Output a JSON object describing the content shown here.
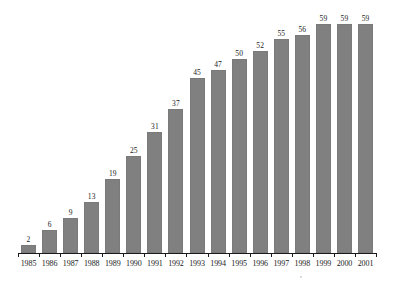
{
  "chart_data": {
    "type": "bar",
    "title": "",
    "subtitle": "",
    "xlabel": "",
    "ylabel": "",
    "categories": [
      "1985",
      "1986",
      "1987",
      "1988",
      "1989",
      "1990",
      "1991",
      "1992",
      "1993",
      "1994",
      "1995",
      "1996",
      "1997",
      "1998",
      "1999",
      "2000",
      "2001"
    ],
    "values": [
      2,
      6,
      9,
      13,
      19,
      25,
      31,
      37,
      45,
      47,
      50,
      52,
      55,
      56,
      59,
      59,
      59
    ],
    "value_labels": [
      "2",
      "6",
      "9",
      "13",
      "19",
      "25",
      "31",
      "37",
      "45",
      "47",
      "50",
      "52",
      "55",
      "56",
      "59",
      "59",
      "59"
    ],
    "ylim": [
      0,
      63
    ],
    "grid": false,
    "legend": null,
    "legend_position": "none",
    "annotations": [],
    "series": [
      {
        "name": "",
        "values": [
          2,
          6,
          9,
          13,
          19,
          25,
          31,
          37,
          45,
          47,
          50,
          52,
          55,
          56,
          59,
          59,
          59
        ]
      }
    ]
  },
  "style": {
    "bar_color": "#808080",
    "bar_border_color": "#7a7a7a",
    "axis_color": "#1a1a1a",
    "text_color": "#1a1a1a",
    "background": "#ffffff"
  }
}
